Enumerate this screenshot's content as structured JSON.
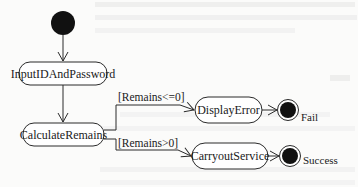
{
  "diagram": {
    "type": "uml-activity",
    "initial_node": {
      "x": 63,
      "y": 23,
      "r": 12
    },
    "activities": [
      {
        "id": "input",
        "label": "InputIDAndPassword",
        "x": 19,
        "y": 62,
        "w": 88,
        "h": 23
      },
      {
        "id": "calc",
        "label": "CalculateRemains",
        "x": 23,
        "y": 123,
        "w": 81,
        "h": 23
      },
      {
        "id": "error",
        "label": "DisplayError",
        "x": 195,
        "y": 97,
        "w": 67,
        "h": 26
      },
      {
        "id": "service",
        "label": "CarryoutService",
        "x": 192,
        "y": 143,
        "w": 76,
        "h": 26
      }
    ],
    "guards": [
      {
        "id": "g1",
        "label": "[Remains<=0]",
        "from": "calc",
        "to": "error"
      },
      {
        "id": "g2",
        "label": "[Remains>0]",
        "from": "calc",
        "to": "service"
      }
    ],
    "final_nodes": [
      {
        "id": "fail",
        "label": "Fail",
        "x": 288,
        "y": 110
      },
      {
        "id": "success",
        "label": "Success",
        "x": 290,
        "y": 157
      }
    ],
    "colors": {
      "line": "#2a2a2a",
      "fill_dark": "#111111",
      "box_fill": "#ffffff",
      "background": "#fbfbfa"
    }
  }
}
